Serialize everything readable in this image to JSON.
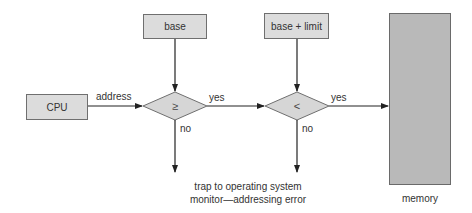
{
  "diagram": {
    "nodes": {
      "cpu": {
        "label": "CPU"
      },
      "base": {
        "label": "base"
      },
      "base_limit": {
        "label": "base + limit"
      },
      "compare_ge": {
        "symbol": "≥"
      },
      "compare_lt": {
        "symbol": "<"
      },
      "memory": {
        "label": "memory"
      },
      "trap": {
        "line1": "trap to operating system",
        "line2": "monitor—addressing error"
      }
    },
    "edges": {
      "cpu_to_ge": {
        "label": "address"
      },
      "ge_to_lt": {
        "label": "yes"
      },
      "lt_to_memory": {
        "label": "yes"
      },
      "ge_no": {
        "label": "no"
      },
      "lt_no": {
        "label": "no"
      }
    },
    "colors": {
      "box_fill": "#dcdcdc",
      "memory_fill": "#b9b9b9",
      "stroke": "#333333"
    }
  }
}
